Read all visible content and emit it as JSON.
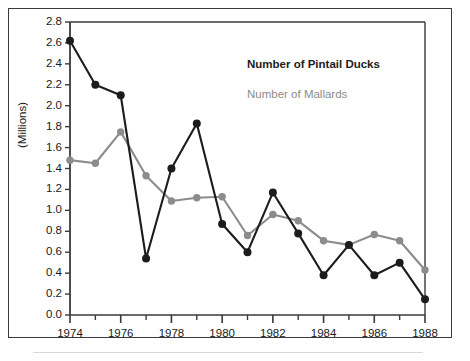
{
  "chart_data": {
    "type": "line",
    "title": "",
    "xlabel": "",
    "ylabel": "(Millions)",
    "xlim": [
      1974,
      1988
    ],
    "ylim": [
      0.0,
      2.8
    ],
    "grid": false,
    "legend_position": "upper-right-inside",
    "x": [
      1974,
      1975,
      1976,
      1977,
      1978,
      1979,
      1980,
      1981,
      1982,
      1983,
      1984,
      1985,
      1986,
      1987,
      1988
    ],
    "xtick_labels": [
      "1974",
      "1976",
      "1978",
      "1980",
      "1982",
      "1984",
      "1986",
      "1988"
    ],
    "xtick_values": [
      1974,
      1976,
      1978,
      1980,
      1982,
      1984,
      1986,
      1988
    ],
    "xminor_values": [
      1975,
      1977,
      1979,
      1981,
      1983,
      1985,
      1987
    ],
    "ytick_labels": [
      "0.0",
      "0.2",
      "0.4",
      "0.6",
      "0.8",
      "1.0",
      "1.2",
      "1.4",
      "1.6",
      "1.8",
      "2.0",
      "2.2",
      "2.4",
      "2.6",
      "2.8"
    ],
    "ytick_values": [
      0.0,
      0.2,
      0.4,
      0.6,
      0.8,
      1.0,
      1.2,
      1.4,
      1.6,
      1.8,
      2.0,
      2.2,
      2.4,
      2.6,
      2.8
    ],
    "series": [
      {
        "name": "Number of Pintail Ducks",
        "color": "#1c1c1c",
        "values": [
          2.62,
          2.2,
          2.1,
          0.54,
          1.4,
          1.83,
          0.87,
          0.6,
          1.17,
          0.78,
          0.38,
          0.67,
          0.38,
          0.5,
          0.15
        ]
      },
      {
        "name": "Number of Mallards",
        "color": "#8c8c8c",
        "values": [
          1.48,
          1.45,
          1.75,
          1.33,
          1.09,
          1.12,
          1.13,
          0.76,
          0.96,
          0.9,
          0.71,
          0.67,
          0.77,
          0.71,
          0.43
        ]
      }
    ]
  },
  "legend": {
    "pintail_label": "Number of Pintail Ducks",
    "mallard_label": "Number of Mallards"
  },
  "axes": {
    "y_axis_title": "(Millions)"
  },
  "colors": {
    "pintail": "#1c1c1c",
    "mallard": "#8c8c8c",
    "frame": "#3a3a3a",
    "background": "#ffffff"
  }
}
